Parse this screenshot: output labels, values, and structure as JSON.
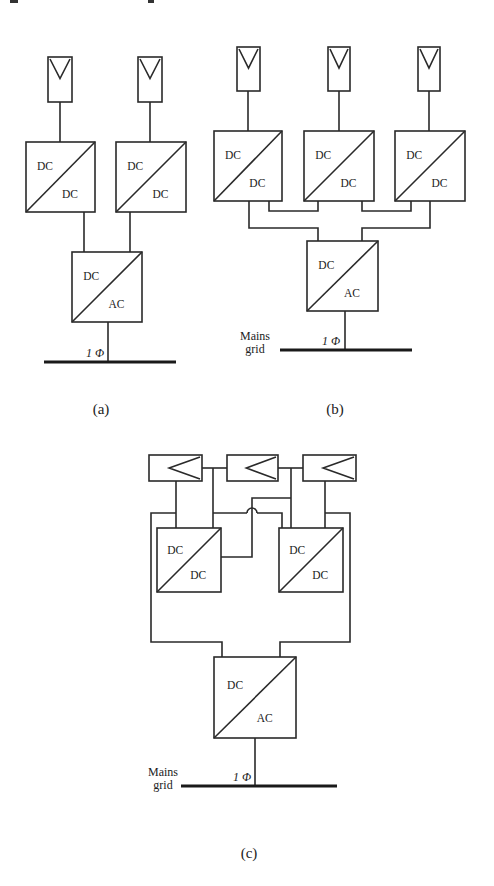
{
  "figure": {
    "panels": [
      {
        "id": "a",
        "caption": "(a)",
        "caption_pos": [
          101,
          414
        ],
        "pv_modules": [
          {
            "x": 48,
            "y": 57,
            "w": 24,
            "h": 45,
            "orientation": "vertical"
          },
          {
            "x": 138,
            "y": 57,
            "w": 24,
            "h": 45,
            "orientation": "vertical"
          }
        ],
        "dcdc_converters": [
          {
            "x": 26,
            "y": 142,
            "w": 69,
            "h": 70,
            "top_label": "DC",
            "bottom_label": "DC"
          },
          {
            "x": 116,
            "y": 142,
            "w": 70,
            "h": 70,
            "top_label": "DC",
            "bottom_label": "DC"
          }
        ],
        "inverter": {
          "x": 72,
          "y": 252,
          "w": 70,
          "h": 70,
          "top_label": "DC",
          "bottom_label": "AC"
        },
        "wires": [
          [
            [
              60,
              102
            ],
            [
              60,
              142
            ]
          ],
          [
            [
              150,
              102
            ],
            [
              150,
              142
            ]
          ],
          [
            [
              84,
              212
            ],
            [
              84,
              252
            ]
          ],
          [
            [
              130,
              212
            ],
            [
              130,
              252
            ]
          ],
          [
            [
              108,
              322
            ],
            [
              108,
              362
            ]
          ]
        ],
        "grid": {
          "x1": 44,
          "x2": 176,
          "y": 362,
          "phase_label": "1 Φ",
          "phase_pos": [
            86,
            357
          ],
          "mains_label": null
        }
      },
      {
        "id": "b",
        "caption": "(b)",
        "caption_pos": [
          335,
          414
        ],
        "pv_modules": [
          {
            "x": 237,
            "y": 47,
            "w": 23,
            "h": 44,
            "orientation": "vertical"
          },
          {
            "x": 328,
            "y": 47,
            "w": 22,
            "h": 44,
            "orientation": "vertical"
          },
          {
            "x": 418,
            "y": 47,
            "w": 22,
            "h": 44,
            "orientation": "vertical"
          }
        ],
        "dcdc_converters": [
          {
            "x": 214,
            "y": 131,
            "w": 68,
            "h": 70,
            "top_label": "DC",
            "bottom_label": "DC"
          },
          {
            "x": 304,
            "y": 131,
            "w": 70,
            "h": 70,
            "top_label": "DC",
            "bottom_label": "DC"
          },
          {
            "x": 395,
            "y": 131,
            "w": 70,
            "h": 70,
            "top_label": "DC",
            "bottom_label": "DC"
          }
        ],
        "inverter": {
          "x": 307,
          "y": 241,
          "w": 71,
          "h": 70,
          "top_label": "DC",
          "bottom_label": "AC"
        },
        "wires": [
          [
            [
              248,
              91
            ],
            [
              248,
              131
            ]
          ],
          [
            [
              339,
              91
            ],
            [
              339,
              131
            ]
          ],
          [
            [
              429,
              91
            ],
            [
              429,
              131
            ]
          ],
          [
            [
              269,
              201
            ],
            [
              269,
              211
            ],
            [
              318,
              211
            ],
            [
              318,
              201
            ]
          ],
          [
            [
              362,
              201
            ],
            [
              362,
              211
            ],
            [
              411,
              211
            ],
            [
              411,
              201
            ]
          ],
          [
            [
              249,
              201
            ],
            [
              249,
              228
            ],
            [
              318,
              228
            ],
            [
              318,
              241
            ]
          ],
          [
            [
              430,
              201
            ],
            [
              430,
              228
            ],
            [
              362,
              228
            ],
            [
              362,
              241
            ]
          ],
          [
            [
              345,
              311
            ],
            [
              345,
              350
            ]
          ]
        ],
        "grid": {
          "x1": 280,
          "x2": 412,
          "y": 350,
          "phase_label": "1 Φ",
          "phase_pos": [
            322,
            345
          ],
          "mains_label": [
            "Mains",
            "grid"
          ],
          "mains_pos": [
            255,
            344
          ]
        }
      },
      {
        "id": "c",
        "caption": "(c)",
        "caption_pos": [
          249,
          858
        ],
        "pv_modules": [
          {
            "x": 149,
            "y": 455,
            "w": 53,
            "h": 26,
            "orientation": "horizontal"
          },
          {
            "x": 227,
            "y": 455,
            "w": 51,
            "h": 26,
            "orientation": "horizontal"
          },
          {
            "x": 303,
            "y": 455,
            "w": 53,
            "h": 26,
            "orientation": "horizontal"
          }
        ],
        "dcdc_converters": [
          {
            "x": 157,
            "y": 528,
            "w": 64,
            "h": 64,
            "top_label": "DC",
            "bottom_label": "DC"
          },
          {
            "x": 279,
            "y": 528,
            "w": 64,
            "h": 64,
            "top_label": "DC",
            "bottom_label": "DC"
          }
        ],
        "inverter": {
          "x": 214,
          "y": 657,
          "w": 82,
          "h": 81,
          "top_label": "DC",
          "bottom_label": "AC"
        },
        "wires": [
          [
            [
              202,
              468
            ],
            [
              227,
              468
            ]
          ],
          [
            [
              278,
              468
            ],
            [
              303,
              468
            ]
          ],
          [
            [
              176,
              481
            ],
            [
              176,
              528
            ]
          ],
          [
            [
              213,
              468
            ],
            [
              213,
              528
            ]
          ],
          [
            [
              291,
              468
            ],
            [
              291,
              528
            ]
          ],
          [
            [
              325,
              481
            ],
            [
              325,
              528
            ]
          ],
          [
            [
              176,
              513
            ],
            [
              151,
              513
            ],
            [
              151,
              642
            ],
            [
              222,
              642
            ],
            [
              222,
              657
            ]
          ],
          [
            [
              325,
              513
            ],
            [
              350,
              513
            ],
            [
              350,
              642
            ],
            [
              280,
              642
            ],
            [
              280,
              657
            ]
          ],
          [
            [
              213,
              513
            ],
            [
              247,
              513
            ]
          ],
          [
            [
              257,
              513
            ],
            [
              282,
              513
            ],
            [
              282,
              528
            ]
          ],
          [
            [
              291,
              498
            ],
            [
              252,
              498
            ],
            [
              252,
              557
            ],
            [
              221,
              557
            ]
          ],
          [
            [
              255,
              738
            ],
            [
              255,
              786
            ]
          ]
        ],
        "hops": [
          {
            "cx": 252,
            "cy": 513,
            "r": 5
          }
        ],
        "grid": {
          "x1": 181,
          "x2": 337,
          "y": 786,
          "phase_label": "1 Φ",
          "phase_pos": [
            233,
            781
          ],
          "mains_label": [
            "Mains",
            "grid"
          ],
          "mains_pos": [
            163,
            780
          ]
        }
      }
    ],
    "scan_marks": [
      {
        "x": 10,
        "y": 0,
        "w": 8,
        "h": 3
      },
      {
        "x": 148,
        "y": 0,
        "w": 6,
        "h": 3
      }
    ]
  }
}
